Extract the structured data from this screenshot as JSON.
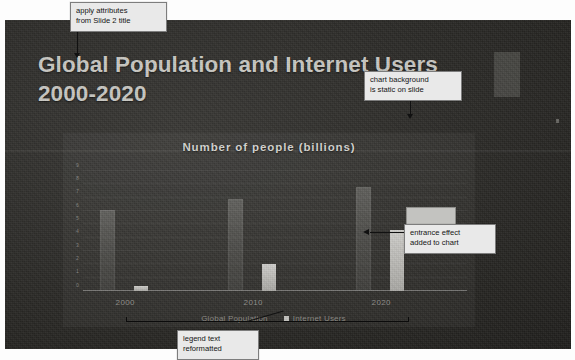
{
  "slide": {
    "title_line1": "Global Population and Internet Users",
    "title_line2": "2000-2020"
  },
  "chart_data": {
    "type": "bar",
    "title": "Number of people (billions)",
    "xlabel": "",
    "ylabel": "",
    "categories": [
      "2000",
      "2010",
      "2020"
    ],
    "yticks": [
      "9",
      "8",
      "7",
      "6",
      "5",
      "4",
      "3",
      "2",
      "1",
      "0"
    ],
    "ylim": [
      0,
      9
    ],
    "grid": true,
    "legend_position": "bottom",
    "series": [
      {
        "name": "Global Population",
        "values": [
          6.1,
          6.9,
          7.8
        ]
      },
      {
        "name": "Internet Users",
        "values": [
          0.4,
          2.0,
          4.6
        ]
      }
    ]
  },
  "annotations": [
    {
      "id": "title-note",
      "text": "apply attributes\nfrom Slide 2 title"
    },
    {
      "id": "background-note",
      "text": "chart background\nis static on slide"
    },
    {
      "id": "entrance-note",
      "text": "entrance effect\nadded to chart"
    },
    {
      "id": "legend-note",
      "text": "legend text\nreformatted"
    }
  ],
  "colors": {
    "slide_background": "#2e2d2a",
    "title_text": "#c9c8c3",
    "series_population": "#78786f",
    "series_internet": "#c3c2be",
    "callout_background": "#e9e9e9",
    "callout_border": "#7d7d7d"
  }
}
